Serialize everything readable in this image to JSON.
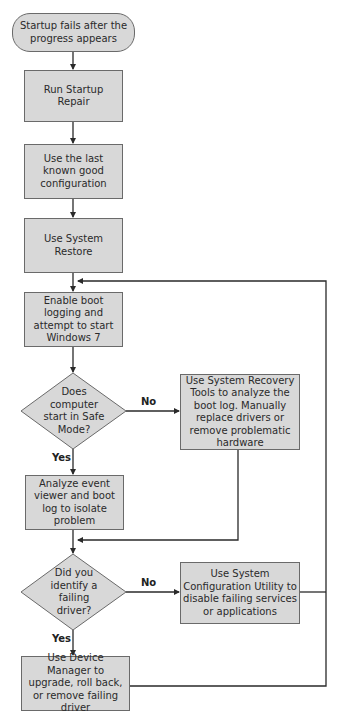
{
  "flowchart": {
    "nodes": {
      "start": {
        "label": "Startup fails after the progress appears",
        "shape": "terminal"
      },
      "startup_repair": {
        "label": "Run Startup Repair",
        "shape": "process"
      },
      "last_known_good": {
        "label": "Use the last known good configuration",
        "shape": "process"
      },
      "system_restore": {
        "label": "Use System Restore",
        "shape": "process"
      },
      "boot_logging": {
        "label": "Enable boot logging and attempt to start Windows 7",
        "shape": "process"
      },
      "safe_mode_decision": {
        "label": "Does computer start in Safe Mode?",
        "shape": "decision"
      },
      "recovery_tools": {
        "label": "Use System Recovery Tools to analyze the boot log. Manually replace drivers or remove problematic hardware",
        "shape": "process"
      },
      "analyze_event_viewer": {
        "label": "Analyze event viewer and boot log to isolate problem",
        "shape": "process"
      },
      "failing_driver_decision": {
        "label": "Did you identify a failing driver?",
        "shape": "decision"
      },
      "system_config": {
        "label": "Use System Configuration Utility to disable failing services or applications",
        "shape": "process"
      },
      "device_manager": {
        "label": "Use Device Manager to upgrade, roll back, or remove failing driver",
        "shape": "process"
      }
    },
    "edge_labels": {
      "safe_mode_no": "No",
      "safe_mode_yes": "Yes",
      "driver_no": "No",
      "driver_yes": "Yes"
    },
    "colors": {
      "node_fill": "#d8d8d8",
      "node_border": "#6a6a6a",
      "line": "#2a2a2a"
    }
  }
}
